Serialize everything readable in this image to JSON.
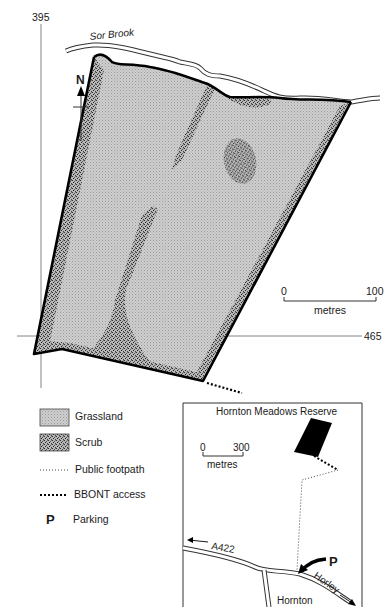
{
  "map": {
    "grid": {
      "easting_label": "395",
      "northing_label": "465"
    },
    "river_label": "Sor Brook",
    "north_label": "N",
    "scale": {
      "start": "0",
      "end": "100",
      "unit": "metres"
    },
    "colors": {
      "grassland": "#c4c4c4",
      "scrub": "#8a8a8a",
      "outline": "#000000",
      "ink": "#1a1a1a"
    }
  },
  "legend": {
    "items": [
      {
        "label": "Grassland",
        "symbol": "grassland-swatch"
      },
      {
        "label": "Scrub",
        "symbol": "scrub-swatch"
      },
      {
        "label": "Public footpath",
        "symbol": "fine-dotted-line"
      },
      {
        "label": "BBONT access",
        "symbol": "bold-dotted-line"
      },
      {
        "label": "Parking",
        "symbol": "P"
      }
    ]
  },
  "inset": {
    "title": "Hornton Meadows Reserve",
    "scale": {
      "start": "0",
      "end": "300",
      "unit": "metres"
    },
    "road_a": "A422",
    "road_b": "Horley",
    "village": "Hornton",
    "parking_symbol": "P"
  }
}
